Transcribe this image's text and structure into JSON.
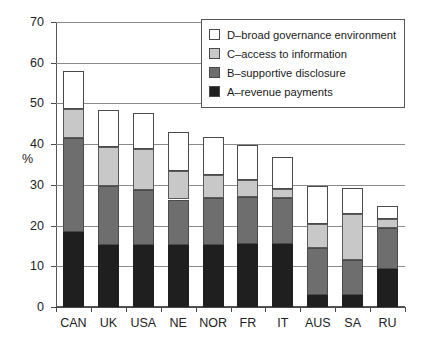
{
  "chart_data": {
    "type": "bar",
    "subtype": "stacked-bar",
    "title": "",
    "xlabel": "",
    "ylabel": "%",
    "ylim": [
      0,
      70
    ],
    "ytick_step": 10,
    "yticks": [
      0,
      10,
      20,
      30,
      40,
      50,
      60,
      70
    ],
    "ytick_labels": [
      "0",
      "10",
      "20",
      "30",
      "40",
      "50",
      "60",
      "70"
    ],
    "grid": true,
    "grid_axis": "y",
    "legend_position": "top-right",
    "categories": [
      "CAN",
      "UK",
      "USA",
      "NE",
      "NOR",
      "FR",
      "IT",
      "AUS",
      "SA",
      "RU"
    ],
    "series": [
      {
        "name": "A–revenue payments",
        "key": "A",
        "color": "#1f1f1f",
        "values": [
          18.3,
          15.2,
          15.2,
          15.2,
          15.3,
          15.4,
          15.5,
          2.9,
          2.9,
          9.4
        ]
      },
      {
        "name": "B–supportive disclosure",
        "key": "B",
        "color": "#6e6e6e",
        "values": [
          23.2,
          14.4,
          13.6,
          11.2,
          11.5,
          11.5,
          11.2,
          11.5,
          8.6,
          10.0
        ]
      },
      {
        "name": "C–access to information",
        "key": "C",
        "color": "#c8c8c8",
        "values": [
          7.1,
          9.7,
          9.9,
          6.9,
          5.7,
          4.3,
          2.4,
          6.1,
          11.3,
          2.1
        ]
      },
      {
        "name": "D–broad governance environment",
        "key": "D",
        "color": "#ffffff",
        "values": [
          9.3,
          9.0,
          8.9,
          9.8,
          9.3,
          8.7,
          7.7,
          9.3,
          6.5,
          3.3
        ]
      }
    ],
    "cumulative_tops": {
      "A": [
        18.3,
        15.2,
        15.2,
        15.2,
        15.3,
        15.4,
        15.5,
        2.9,
        2.9,
        9.4
      ],
      "B": [
        41.5,
        29.6,
        28.8,
        26.4,
        26.8,
        26.9,
        26.7,
        14.4,
        11.5,
        19.4
      ],
      "C": [
        48.6,
        39.3,
        38.7,
        33.3,
        32.5,
        31.2,
        29.1,
        20.5,
        22.8,
        21.5
      ],
      "D": [
        57.9,
        48.3,
        47.6,
        43.1,
        41.8,
        39.9,
        36.8,
        29.8,
        29.3,
        24.8
      ]
    },
    "totals": [
      57.9,
      48.3,
      47.6,
      43.1,
      41.8,
      39.9,
      36.8,
      29.8,
      29.3,
      24.8
    ]
  },
  "legend": {
    "entries": [
      {
        "label": "D–broad governance environment",
        "swatch": "#ffffff"
      },
      {
        "label": "C–access to information",
        "swatch": "#c8c8c8"
      },
      {
        "label": "B–supportive disclosure",
        "swatch": "#6e6e6e"
      },
      {
        "label": "A–revenue payments",
        "swatch": "#1f1f1f"
      }
    ]
  }
}
